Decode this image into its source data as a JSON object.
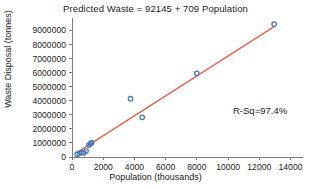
{
  "chart_data": {
    "type": "scatter",
    "title": "Predicted Waste = 92145 + 709 Population",
    "xlabel": "Population (thousands)",
    "ylabel": "Waste Disposal (tonnes)",
    "xlim": [
      0,
      14800
    ],
    "ylim": [
      0,
      9600000
    ],
    "xticks": [
      0,
      2000,
      4000,
      6000,
      8000,
      10000,
      12000,
      14000
    ],
    "xtick_labels": [
      "0",
      "2000",
      "4000",
      "6000",
      "8000",
      "10000",
      "12000",
      "14000"
    ],
    "yticks": [
      0,
      1000000,
      2000000,
      3000000,
      4000000,
      5000000,
      6000000,
      7000000,
      8000000,
      9000000
    ],
    "ytick_labels": [
      "0",
      "1000000",
      "2000000",
      "3000000",
      "4000000",
      "5000000",
      "6000000",
      "7000000",
      "8000000",
      "9000000"
    ],
    "grid": false,
    "legend": false,
    "marker_color": "#4878b0",
    "line_color": "#e8604c",
    "points": [
      {
        "x": 330,
        "y": 200000
      },
      {
        "x": 480,
        "y": 260000
      },
      {
        "x": 640,
        "y": 320000
      },
      {
        "x": 760,
        "y": 300000
      },
      {
        "x": 900,
        "y": 420000
      },
      {
        "x": 1080,
        "y": 850000
      },
      {
        "x": 1180,
        "y": 940000
      },
      {
        "x": 1250,
        "y": 1020000
      },
      {
        "x": 3750,
        "y": 4150000
      },
      {
        "x": 4500,
        "y": 2820000
      },
      {
        "x": 8000,
        "y": 5950000
      },
      {
        "x": 12950,
        "y": 9450000
      }
    ],
    "fit_line": {
      "intercept": 92145,
      "slope": 709,
      "x_start": 330,
      "x_end": 12950
    },
    "annotation": {
      "text": "R-Sq=97.4%",
      "x": 233,
      "y": 105
    }
  }
}
